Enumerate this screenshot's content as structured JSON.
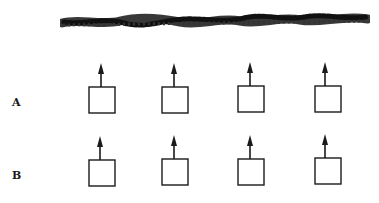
{
  "figure": {
    "title_redacted": true,
    "rows": [
      {
        "label": "A",
        "label_pos": {
          "x": 12,
          "y": 96
        },
        "items": [
          {
            "box": {
              "x": 89,
              "y": 87,
              "w": 26,
              "h": 26
            },
            "arrow": "up"
          },
          {
            "box": {
              "x": 162,
              "y": 87,
              "w": 26,
              "h": 26
            },
            "arrow": "up"
          },
          {
            "box": {
              "x": 238,
              "y": 86,
              "w": 26,
              "h": 26
            },
            "arrow": "up"
          },
          {
            "box": {
              "x": 315,
              "y": 86,
              "w": 26,
              "h": 26
            },
            "arrow": "up"
          }
        ]
      },
      {
        "label": "B",
        "label_pos": {
          "x": 12,
          "y": 169
        },
        "items": [
          {
            "box": {
              "x": 89,
              "y": 160,
              "w": 26,
              "h": 26
            },
            "arrow": "up"
          },
          {
            "box": {
              "x": 162,
              "y": 159,
              "w": 26,
              "h": 26
            },
            "arrow": "up"
          },
          {
            "box": {
              "x": 238,
              "y": 159,
              "w": 26,
              "h": 26
            },
            "arrow": "up"
          },
          {
            "box": {
              "x": 315,
              "y": 158,
              "w": 26,
              "h": 26
            },
            "arrow": "up"
          }
        ]
      }
    ],
    "colors": {
      "ink": "#1a1a1a",
      "background": "#ffffff"
    }
  }
}
